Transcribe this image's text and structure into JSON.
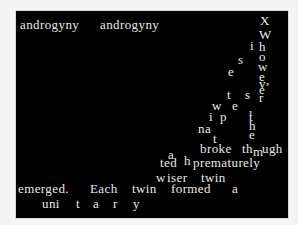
{
  "stage": {
    "background": "#000000",
    "text_color": "#e8e8e8",
    "glyphs": [
      {
        "text": "androgyny",
        "x": 20,
        "y": 7
      },
      {
        "text": "androgyny",
        "x": 100,
        "y": 7
      },
      {
        "text": "X",
        "x": 260,
        "y": 3
      },
      {
        "text": "W",
        "x": 259,
        "y": 17
      },
      {
        "text": "i",
        "x": 250,
        "y": 28
      },
      {
        "text": "h",
        "x": 259,
        "y": 29
      },
      {
        "text": "o",
        "x": 259,
        "y": 39
      },
      {
        "text": "s",
        "x": 238,
        "y": 42
      },
      {
        "text": "w",
        "x": 258,
        "y": 49
      },
      {
        "text": "e",
        "x": 228,
        "y": 54
      },
      {
        "text": "e",
        "x": 259,
        "y": 59
      },
      {
        "text": "v",
        "x": 259,
        "y": 66
      },
      {
        "text": ",",
        "x": 266,
        "y": 62
      },
      {
        "text": "e",
        "x": 259,
        "y": 72
      },
      {
        "text": "t",
        "x": 227,
        "y": 77
      },
      {
        "text": "s",
        "x": 245,
        "y": 77
      },
      {
        "text": "r",
        "x": 259,
        "y": 80
      },
      {
        "text": "w",
        "x": 212,
        "y": 88
      },
      {
        "text": "e",
        "x": 232,
        "y": 88
      },
      {
        "text": ",",
        "x": 249,
        "y": 90
      },
      {
        "text": "i",
        "x": 209,
        "y": 99
      },
      {
        "text": "p",
        "x": 220,
        "y": 99
      },
      {
        "text": "t",
        "x": 249,
        "y": 99
      },
      {
        "text": "h",
        "x": 249,
        "y": 108
      },
      {
        "text": "na",
        "x": 198,
        "y": 111
      },
      {
        "text": "e",
        "x": 249,
        "y": 117
      },
      {
        "text": "t",
        "x": 213,
        "y": 121
      },
      {
        "text": "broke",
        "x": 200,
        "y": 131
      },
      {
        "text": "th",
        "x": 242,
        "y": 131
      },
      {
        "text": "m",
        "x": 253,
        "y": 134
      },
      {
        "text": "ugh",
        "x": 262,
        "y": 131
      },
      {
        "text": "a",
        "x": 168,
        "y": 137
      },
      {
        "text": "ted",
        "x": 160,
        "y": 145
      },
      {
        "text": "h",
        "x": 184,
        "y": 143
      },
      {
        "text": "prematurely",
        "x": 193,
        "y": 145
      },
      {
        "text": "w",
        "x": 156,
        "y": 160
      },
      {
        "text": "iser",
        "x": 167,
        "y": 160
      },
      {
        "text": "twin",
        "x": 201,
        "y": 160
      },
      {
        "text": "emerged.",
        "x": 18,
        "y": 171
      },
      {
        "text": "Each",
        "x": 90,
        "y": 171
      },
      {
        "text": "twin",
        "x": 132,
        "y": 171
      },
      {
        "text": "formed",
        "x": 171,
        "y": 171
      },
      {
        "text": "a",
        "x": 232,
        "y": 171
      },
      {
        "text": "uni",
        "x": 42,
        "y": 186
      },
      {
        "text": "t",
        "x": 76,
        "y": 186
      },
      {
        "text": "a",
        "x": 93,
        "y": 186
      },
      {
        "text": "r",
        "x": 113,
        "y": 186
      },
      {
        "text": "y",
        "x": 133,
        "y": 186
      }
    ]
  }
}
